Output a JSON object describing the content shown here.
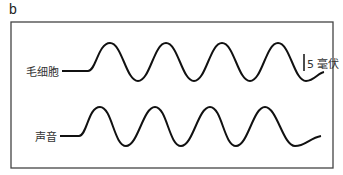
{
  "figure": {
    "panel_letter": "b",
    "traces": [
      {
        "label": "毛细胞",
        "name": "hair-cell"
      },
      {
        "label": "声音",
        "name": "sound"
      }
    ],
    "scale_bar": {
      "label": "5 毫伏"
    }
  }
}
